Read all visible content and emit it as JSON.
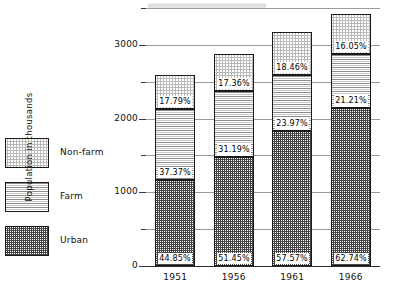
{
  "chart_data": {
    "type": "bar",
    "subtype": "stacked-bar",
    "title": "",
    "xlabel": "",
    "ylabel": "Population in thousands",
    "categories": [
      "1951",
      "1956",
      "1961",
      "1966"
    ],
    "ylim": [
      0,
      3500
    ],
    "yticks": [
      0,
      1000,
      2000,
      3000
    ],
    "ytick_labels": [
      "0",
      "1000",
      "2000",
      "3000"
    ],
    "yminor_ticks": [
      500,
      1500,
      2500,
      3500
    ],
    "grid": true,
    "legend_position": "left",
    "stack_order_bottom_to_top": [
      "Urban",
      "Farm",
      "Non-farm"
    ],
    "totals": [
      2590,
      2870,
      3170,
      3420
    ],
    "series": [
      {
        "name": "Urban",
        "pattern": "dark-checker",
        "percent_labels": [
          "44.85%",
          "51.45%",
          "57.57%",
          "62.74%"
        ],
        "percents": [
          44.85,
          51.45,
          57.57,
          62.74
        ],
        "values": [
          1162,
          1477,
          1825,
          2146
        ]
      },
      {
        "name": "Farm",
        "pattern": "horizontal-lines",
        "percent_labels": [
          "37.37%",
          "31.19%",
          "23.97%",
          "21.21%"
        ],
        "percents": [
          37.37,
          31.19,
          23.97,
          21.21
        ],
        "values": [
          968,
          895,
          760,
          726
        ]
      },
      {
        "name": "Non-farm",
        "pattern": "light-checker",
        "percent_labels": [
          "17.79%",
          "17.36%",
          "18.46%",
          "16.05%"
        ],
        "percents": [
          17.79,
          17.36,
          18.46,
          16.05
        ],
        "values": [
          461,
          498,
          585,
          549
        ]
      }
    ]
  },
  "legend": {
    "items": [
      {
        "label": "Non-farm",
        "pattern": "light-checker"
      },
      {
        "label": "Farm",
        "pattern": "horizontal-lines"
      },
      {
        "label": "Urban",
        "pattern": "dark-checker"
      }
    ]
  },
  "axis": {
    "y_title": "Population in thousands",
    "y_labels": [
      "3000",
      "2000",
      "1000",
      "0"
    ],
    "x_labels": [
      "1951",
      "1956",
      "1961",
      "1966"
    ]
  },
  "colors": {
    "line": "#1a1a1a",
    "grid": "#9a9a9a",
    "text": "#111111",
    "urban": "#4a4a4a",
    "farm": "#8c8c8c",
    "nonfarm": "#b9b9b9"
  }
}
